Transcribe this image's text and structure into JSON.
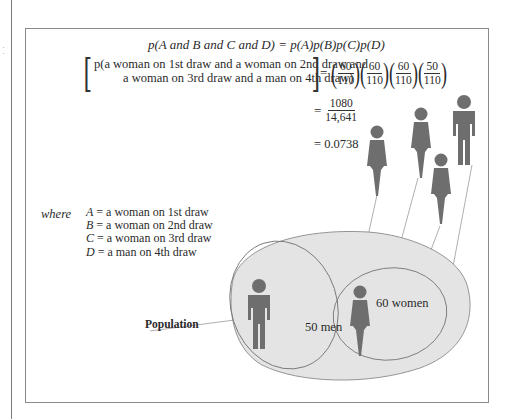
{
  "equation": {
    "general": "p(A and B and C and D) = p(A)p(B)p(C)p(D)",
    "general_parts": {
      "lhs": "p(A and B and C and D)",
      "rhs": "= p(A)p(B)p(C)p(D)"
    },
    "specific_line1": "p(a woman on 1st draw and a woman on 2nd draw and",
    "specific_line2": "a woman on 3rd draw and a man on 4th draw)",
    "equals": "=",
    "fractions": [
      {
        "num": "60",
        "den": "110"
      },
      {
        "num": "60",
        "den": "110"
      },
      {
        "num": "60",
        "den": "110"
      },
      {
        "num": "50",
        "den": "110"
      }
    ],
    "product": {
      "num": "1080",
      "den": "14,641"
    },
    "result": "= 0.0738"
  },
  "definitions": {
    "label": "where",
    "items": [
      {
        "var": "A",
        "text": " = a woman on 1st draw"
      },
      {
        "var": "B",
        "text": " = a woman on 2nd draw"
      },
      {
        "var": "C",
        "text": " = a woman on 3rd draw"
      },
      {
        "var": "D",
        "text": " = a man on 4th draw"
      }
    ]
  },
  "population": {
    "label": "Population",
    "men_label": "50 men",
    "women_label": "60 women",
    "men_count": 50,
    "women_count": 60,
    "total": 110
  },
  "draws": [
    {
      "order": 1,
      "figure": "woman"
    },
    {
      "order": 2,
      "figure": "woman"
    },
    {
      "order": 3,
      "figure": "woman"
    },
    {
      "order": 4,
      "figure": "man"
    }
  ],
  "colors": {
    "figure": "#6e6e6e",
    "population_fill": "#e4e4e4",
    "outline": "#8a8a8a",
    "text": "#2a2a2a"
  }
}
